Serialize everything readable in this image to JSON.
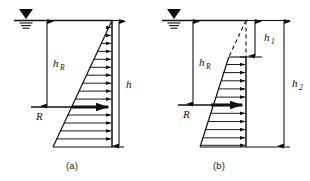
{
  "figure": {
    "type": "engineering-diagram",
    "panels": [
      {
        "id": "a",
        "caption": "(a)",
        "labels": {
          "resultant": "R",
          "resultant_depth": "h",
          "resultant_depth_sub": "R",
          "total_depth": "h"
        },
        "water_table_icon": "water-table-icon",
        "pressure_arrow_count": 14,
        "distribution": "triangular-full"
      },
      {
        "id": "b",
        "caption": "(b)",
        "labels": {
          "resultant": "R",
          "resultant_depth": "h",
          "resultant_depth_sub": "R",
          "upper_depth": "h",
          "upper_depth_sub": "1",
          "lower_depth": "h",
          "lower_depth_sub": "2"
        },
        "water_table_icon": "water-table-icon",
        "pressure_arrow_count": 11,
        "distribution": "triangular-truncated-dashed-top"
      }
    ],
    "colors": {
      "line": "#111111",
      "background": "#ffffff",
      "text": "#1a1a1a"
    }
  }
}
